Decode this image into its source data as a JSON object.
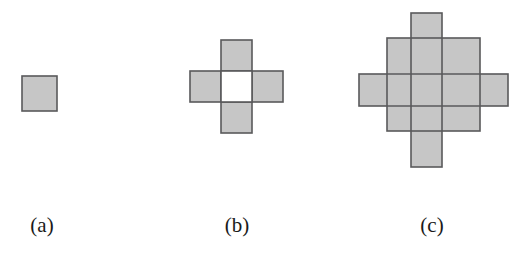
{
  "figure": {
    "width": 527,
    "height": 255,
    "background_color": "#ffffff",
    "fill_color": "#c6c6c6",
    "stroke_color": "#59595b",
    "stroke_width": 1.6,
    "cell_size": 31
  },
  "panels": [
    {
      "id": "a",
      "caption": "(a)",
      "caption_x": 42,
      "caption_y": 232,
      "description": "single square",
      "cell_count": 1,
      "origin_x": 22,
      "origin_y": 76,
      "rects": [
        {
          "name": "center-square",
          "x": 0,
          "y": 0,
          "w": 35,
          "h": 35
        }
      ]
    },
    {
      "id": "b",
      "caption": "(b)",
      "caption_x": 237,
      "caption_y": 232,
      "description": "plus shape of four squares with hollow center",
      "cell_count": 4,
      "origin_x": 190,
      "origin_y": 40,
      "rects": [
        {
          "name": "top-square",
          "x": 31,
          "y": 0,
          "w": 31,
          "h": 31
        },
        {
          "name": "left-square",
          "x": 0,
          "y": 31,
          "w": 31,
          "h": 31
        },
        {
          "name": "right-square",
          "x": 62,
          "y": 31,
          "w": 31,
          "h": 31
        },
        {
          "name": "bottom-square",
          "x": 31,
          "y": 62,
          "w": 31,
          "h": 31
        }
      ],
      "hollow": [
        {
          "name": "center-hole",
          "x": 31,
          "y": 31,
          "w": 31,
          "h": 31
        }
      ]
    },
    {
      "id": "c",
      "caption": "(c)",
      "caption_x": 432,
      "caption_y": 232,
      "description": "overlapping vertical bar, horizontal bar and central 3x3 block forming a cross-diamond",
      "cell_count": 21,
      "origin_x": 359,
      "origin_y": 13,
      "rects": [
        {
          "name": "vertical-bar",
          "x": 52,
          "y": 0,
          "w": 31,
          "h": 154
        },
        {
          "name": "horizontal-bar",
          "x": 0,
          "y": 61,
          "w": 149,
          "h": 32
        },
        {
          "name": "center-block",
          "x": 28,
          "y": 25,
          "w": 93,
          "h": 93
        }
      ],
      "inner_lines": [
        {
          "name": "grid-line-v-1",
          "x1": 52,
          "y1": 25,
          "x2": 52,
          "y2": 118
        },
        {
          "name": "grid-line-v-2",
          "x1": 83,
          "y1": 25,
          "x2": 83,
          "y2": 118
        },
        {
          "name": "grid-line-h-1",
          "x1": 28,
          "y1": 61,
          "x2": 121,
          "y2": 61
        },
        {
          "name": "grid-line-h-2",
          "x1": 28,
          "y1": 93,
          "x2": 121,
          "y2": 93
        }
      ]
    }
  ]
}
